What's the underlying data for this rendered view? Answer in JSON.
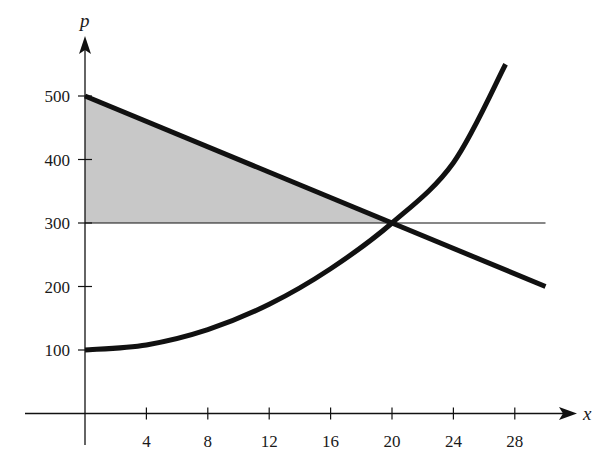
{
  "chart_data": {
    "type": "line",
    "title": "",
    "xlabel": "x",
    "ylabel": "p",
    "xlim": [
      0,
      31
    ],
    "ylim": [
      0,
      580
    ],
    "x_ticks": [
      4,
      8,
      12,
      16,
      20,
      24,
      28
    ],
    "y_ticks": [
      100,
      200,
      300,
      400,
      500
    ],
    "grid": false,
    "legend": null,
    "series": [
      {
        "name": "demand",
        "style": "thick line",
        "equation": "p = 500 - 10x",
        "x": [
          0,
          20,
          30
        ],
        "y": [
          500,
          300,
          200
        ]
      },
      {
        "name": "supply",
        "style": "thick curve",
        "equation": "p ≈ 100 + 0.5x^2",
        "x": [
          0,
          4,
          8,
          12,
          16,
          20,
          24,
          27.4
        ],
        "y": [
          100,
          108,
          132,
          172,
          228,
          300,
          395,
          550
        ]
      },
      {
        "name": "equilibrium price line",
        "style": "thin horizontal line",
        "x": [
          0,
          30
        ],
        "y": [
          300,
          300
        ]
      }
    ],
    "shaded_region": {
      "description": "consumer surplus: area between demand line and p = 300 from x = 0 to x = 20",
      "vertices": [
        [
          0,
          500
        ],
        [
          20,
          300
        ],
        [
          0,
          300
        ]
      ],
      "color": "#c8c8c8"
    },
    "equilibrium_point": {
      "x": 20,
      "p": 300
    }
  },
  "axes": {
    "x_label": "x",
    "y_label": "p",
    "x_tick_labels": [
      "4",
      "8",
      "12",
      "16",
      "20",
      "24",
      "28"
    ],
    "y_tick_labels": [
      "100",
      "200",
      "300",
      "400",
      "500"
    ]
  },
  "colors": {
    "line": "#111111",
    "shade": "#c8c8c8",
    "background": "#ffffff"
  }
}
